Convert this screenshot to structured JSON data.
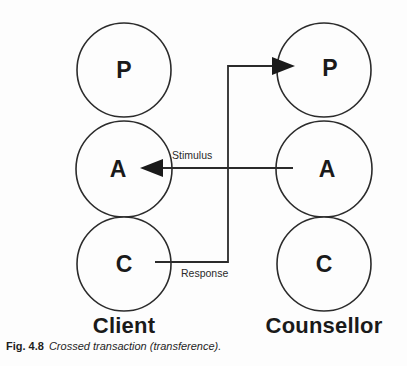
{
  "figure": {
    "caption_number": "Fig. 4.8",
    "caption_text": "Crossed transaction (transference).",
    "background_color": "#fdfdfd",
    "stroke_color": "#2b2b2b",
    "text_color": "#1a1a1a"
  },
  "columns": [
    {
      "id": "client",
      "label": "Client",
      "label_x": 124,
      "label_y": 325,
      "center_x": 124,
      "ego_states": [
        {
          "letter": "P",
          "name": "parent",
          "cx": 124,
          "cy": 70,
          "r": 47
        },
        {
          "letter": "A",
          "name": "adult",
          "cx": 124,
          "cy": 169,
          "r": 48
        },
        {
          "letter": "C",
          "name": "child",
          "cx": 124,
          "cy": 264,
          "r": 47
        }
      ]
    },
    {
      "id": "counsellor",
      "label": "Counsellor",
      "label_x": 324,
      "label_y": 325,
      "center_x": 324,
      "ego_states": [
        {
          "letter": "P",
          "name": "parent",
          "cx": 324,
          "cy": 70,
          "r": 47
        },
        {
          "letter": "A",
          "name": "adult",
          "cx": 324,
          "cy": 169,
          "r": 48
        },
        {
          "letter": "C",
          "name": "child",
          "cx": 324,
          "cy": 264,
          "r": 47
        }
      ]
    }
  ],
  "transactions": [
    {
      "id": "stimulus",
      "label": "Stimulus",
      "from": "counsellor-adult",
      "to": "client-adult",
      "path": "M 293 168 L 146 168",
      "arrow_points": "140,168 163,159 163,177",
      "label_x": 172,
      "label_y": 155
    },
    {
      "id": "response",
      "label": "Response",
      "from": "client-child",
      "to": "counsellor-parent",
      "path": "M 155 262 L 228 262 L 228 66 L 287 66",
      "arrow_points": "295,66 272,57 272,75",
      "label_x": 181,
      "label_y": 273
    }
  ]
}
